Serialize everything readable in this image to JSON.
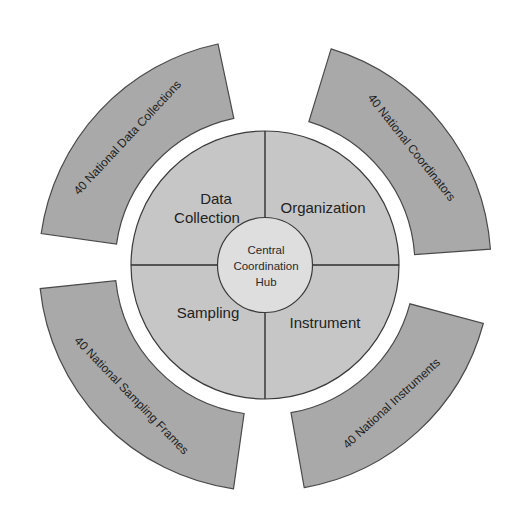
{
  "diagram": {
    "center": {
      "x": 265,
      "y": 265
    },
    "colors": {
      "outer_arc_fill": "#a9a9a9",
      "quadrant_fill": "#c6c6c6",
      "hub_fill": "#dedede",
      "stroke": "#3a3a3a",
      "text": "#222222"
    },
    "hub": {
      "lines": [
        "Central",
        "Coordination",
        "Hub"
      ]
    },
    "quadrants": [
      {
        "position": "top-left",
        "lines": [
          "Data",
          "Collection"
        ]
      },
      {
        "position": "top-right",
        "lines": [
          "Organization"
        ]
      },
      {
        "position": "bottom-left",
        "lines": [
          "Sampling"
        ]
      },
      {
        "position": "bottom-right",
        "lines": [
          "Instrument"
        ]
      }
    ],
    "outer_arcs": [
      {
        "position": "top-left",
        "label": "40 National Data Collections"
      },
      {
        "position": "top-right",
        "label": "40 National Coordinators"
      },
      {
        "position": "bottom-right",
        "label": "40 National Instruments"
      },
      {
        "position": "bottom-left",
        "label": "40 National Sampling Frames"
      }
    ]
  }
}
